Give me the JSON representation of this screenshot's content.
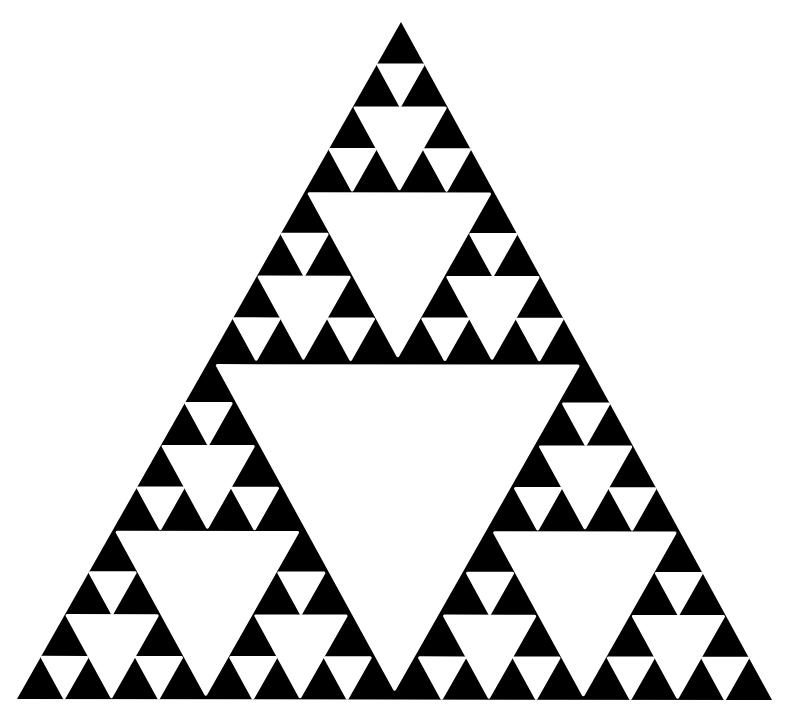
{
  "figure": {
    "title": "Sierpinski triangle",
    "background_color": "#ffffff",
    "fill_color": "#000000",
    "hole_color": "#ffffff",
    "outer_triangle": {
      "apex": [
        401,
        22
      ],
      "bottom_left": [
        17,
        699
      ],
      "bottom_right": [
        772,
        700
      ]
    },
    "recursion_depth": 4,
    "hole_shrink": 0.955,
    "corner_rounding": 3
  }
}
